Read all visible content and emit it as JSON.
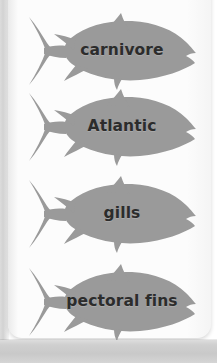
{
  "page": {
    "background_color": "#e8e8e8",
    "sheet_color": "#fcfcfc",
    "kind": "scanned-worksheet-page"
  },
  "fish_diagram": {
    "shape_name": "tuna-fish-silhouette",
    "fill_color": "#9a9a9a",
    "outline_color": "#8f8f8f",
    "label_color": "#2c2c2c",
    "facing": "right",
    "count": 4,
    "items": [
      {
        "label": "carnivore"
      },
      {
        "label": "Atlantic"
      },
      {
        "label": "gills"
      },
      {
        "label": "pectoral fins"
      }
    ]
  }
}
